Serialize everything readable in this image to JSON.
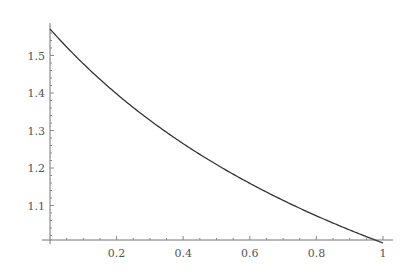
{
  "chart_data": {
    "type": "line",
    "title": "",
    "xlabel": "",
    "ylabel": "",
    "xlim": [
      0,
      1
    ],
    "ylim": [
      1.0,
      1.5708
    ],
    "grid": false,
    "legend": null,
    "x_ticks": [
      "0.2",
      "0.4",
      "0.6",
      "0.8",
      "1"
    ],
    "y_ticks": [
      "1.1",
      "1.2",
      "1.3",
      "1.4",
      "1.5"
    ],
    "series": [
      {
        "name": "curve",
        "x": [
          0,
          0.1,
          0.2,
          0.3,
          0.4,
          0.5,
          0.6,
          0.7,
          0.8,
          0.85,
          0.9,
          0.95,
          0.98,
          1.0
        ],
        "y": [
          1.571,
          1.482,
          1.398,
          1.32,
          1.241,
          1.209,
          1.159,
          1.11,
          1.07,
          1.055,
          1.039,
          1.025,
          1.013,
          1.0
        ]
      }
    ]
  }
}
